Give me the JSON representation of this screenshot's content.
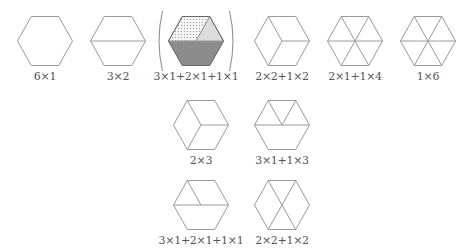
{
  "figure": {
    "stroke_color": "#9a9a9a",
    "shade_dark": "#8c8c8c",
    "shade_light": "#dcdcdc",
    "shade_dotted": "#f4f4f4",
    "hexagons": [
      {
        "id": "hex-6x1",
        "cx": 45,
        "cy": 41,
        "label": "6×1",
        "partition": "whole"
      },
      {
        "id": "hex-3x2",
        "cx": 118,
        "cy": 41,
        "label": "3×2",
        "partition": "two-trapezoids"
      },
      {
        "id": "hex-3x1-2x1-1x1",
        "cx": 196,
        "cy": 41,
        "label": "3×1+2×1+1×1",
        "partition": "trapezoid-rhombus-triangle",
        "shaded": true,
        "bracketed": true
      },
      {
        "id": "hex-2x2-1x2",
        "cx": 282,
        "cy": 41,
        "label": "2×2+1×2",
        "partition": "rhombus-pair-triangles"
      },
      {
        "id": "hex-2x1-1x4",
        "cx": 355,
        "cy": 41,
        "label": "2×1+1×4",
        "partition": "rhombus-four-triangles"
      },
      {
        "id": "hex-1x6",
        "cx": 428,
        "cy": 41,
        "label": "1×6",
        "partition": "six-triangles"
      },
      {
        "id": "hex-2x3",
        "cx": 201,
        "cy": 125,
        "label": "2×3",
        "partition": "three-rhombi"
      },
      {
        "id": "hex-3x1-1x3",
        "cx": 282,
        "cy": 125,
        "label": "3×1+1×3",
        "partition": "trapezoid-three-triangles"
      },
      {
        "id": "hex-3x1-2x1-1x1-b",
        "cx": 201,
        "cy": 205,
        "label": "3×1+2×1+1×1",
        "partition": "trapezoid-rhombus-triangle"
      },
      {
        "id": "hex-2x2-1x2-b",
        "cx": 282,
        "cy": 205,
        "label": "2×2+1×2",
        "partition": "two-rhombi-two-triangles"
      }
    ]
  }
}
